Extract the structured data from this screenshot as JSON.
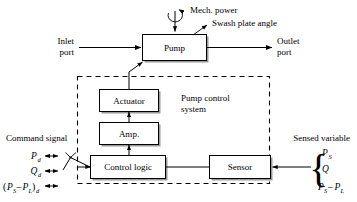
{
  "figure": {
    "type": "block-diagram",
    "background_color": "#ffffff",
    "line_color": "#000000"
  },
  "blocks": {
    "pump": {
      "label": "Pump"
    },
    "actuator": {
      "label": "Actuator"
    },
    "amp": {
      "label": "Amp."
    },
    "control_logic": {
      "label": "Control logic"
    },
    "sensor": {
      "label": "Sensor"
    }
  },
  "annotations": {
    "mech_power": "Mech. power",
    "swash_plate_angle": "Swash plate angle",
    "inlet_port_line1": "Inlet",
    "inlet_port_line2": "port",
    "outlet_port_line1": "Outlet",
    "outlet_port_line2": "port",
    "pump_control_system_line1": "Pump control",
    "pump_control_system_line2": "system",
    "command_signal": "Command signal",
    "sensed_variable": "Sensed variable"
  },
  "command_inputs": [
    {
      "base": "P",
      "sub": "d",
      "full": "Pd"
    },
    {
      "base": "Q",
      "sub": "d",
      "full": "Qd"
    },
    {
      "base": "(PS − PL)",
      "sub": "d",
      "full": "(PS − PL)d"
    }
  ],
  "command_input_parts": {
    "row1_base": "P",
    "row1_sub": "d",
    "row2_base": "Q",
    "row2_sub": "d",
    "row3_open": "(",
    "row3_p1": "P",
    "row3_p1sub": "S",
    "row3_minus": "–",
    "row3_p2": "P",
    "row3_p2sub": "L",
    "row3_close": ")",
    "row3_sub": "d"
  },
  "sensed_variables": [
    {
      "base": "P",
      "sub": "S",
      "full": "PS"
    },
    {
      "base": "Q",
      "sub": "",
      "full": "Q"
    },
    {
      "base": "PS − PL",
      "sub": "",
      "full": "PS − PL"
    }
  ],
  "sensed_variable_parts": {
    "row1_base": "P",
    "row1_sub": "S",
    "row2_base": "Q",
    "row3_p1": "P",
    "row3_p1sub": "S",
    "row3_minus": "–",
    "row3_p2": "P",
    "row3_p2sub": "L",
    "brace_glyph": "{"
  },
  "icons": {
    "rotation_arrow": "rotation-arrow-icon",
    "selector_switch": "selector-switch-icon"
  }
}
